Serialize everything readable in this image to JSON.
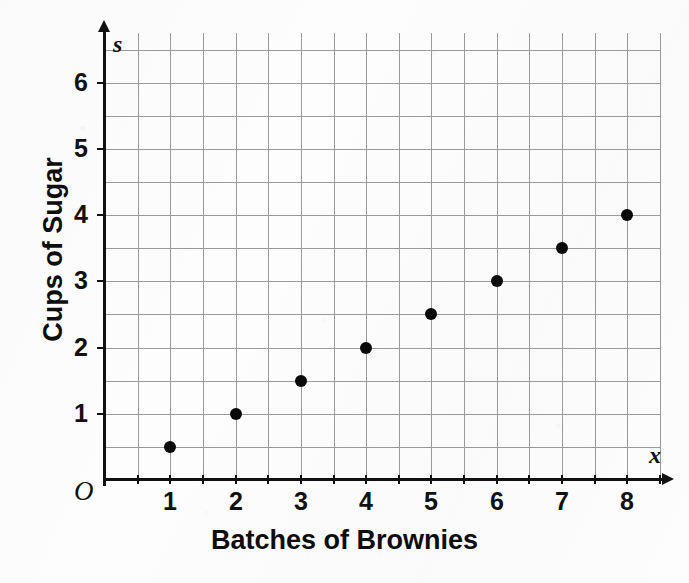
{
  "chart_data": {
    "type": "scatter",
    "title": "",
    "xlabel": "Batches of Brownies",
    "ylabel": "Cups of Sugar",
    "x_variable": "x",
    "y_variable": "s",
    "origin_label": "O",
    "x": [
      1,
      2,
      3,
      4,
      5,
      6,
      7,
      8
    ],
    "values": [
      0.5,
      1,
      1.5,
      2,
      2.5,
      3,
      3.5,
      4
    ],
    "points": [
      {
        "x": 1,
        "y": 0.5
      },
      {
        "x": 2,
        "y": 1
      },
      {
        "x": 3,
        "y": 1.5
      },
      {
        "x": 4,
        "y": 2
      },
      {
        "x": 5,
        "y": 2.5
      },
      {
        "x": 6,
        "y": 3
      },
      {
        "x": 7,
        "y": 3.5
      },
      {
        "x": 8,
        "y": 4
      }
    ],
    "xlim": [
      0,
      8.5
    ],
    "ylim": [
      0,
      6.8
    ],
    "x_tick_labels": [
      "1",
      "2",
      "3",
      "4",
      "5",
      "6",
      "7",
      "8"
    ],
    "y_tick_labels": [
      "1",
      "2",
      "3",
      "4",
      "5",
      "6"
    ],
    "x_ticks": [
      1,
      2,
      3,
      4,
      5,
      6,
      7,
      8
    ],
    "y_ticks": [
      1,
      2,
      3,
      4,
      5,
      6
    ],
    "grid": true,
    "grid_step": 0.5,
    "legend": "none",
    "marker_color": "#0a0a0a",
    "grid_color": "#9a9a9a",
    "axis_color": "#111111",
    "background_color": "#fdfdfd"
  }
}
